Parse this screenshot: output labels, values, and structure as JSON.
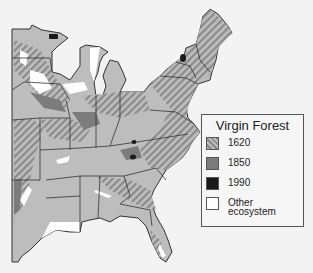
{
  "map": {
    "title": "Virgin Forest",
    "region": "Eastern United States",
    "colors": {
      "background": "#f3f3f3",
      "base_1850": "#7c7c7c",
      "base_fill": "#bdbdbd",
      "hatch_1620": "#8a8a8a",
      "1990": "#1a1a1a",
      "other": "#ffffff",
      "border": "#333333"
    }
  },
  "legend": {
    "title": "Virgin Forest",
    "items": [
      {
        "label": "1620",
        "style": "hatched",
        "color": "#8a8a8a"
      },
      {
        "label": "1850",
        "style": "solid",
        "color": "#7c7c7c"
      },
      {
        "label": "1990",
        "style": "solid",
        "color": "#1a1a1a"
      },
      {
        "label_line1": "Other",
        "label_line2": "ecosystem",
        "style": "solid",
        "color": "#ffffff"
      }
    ]
  }
}
